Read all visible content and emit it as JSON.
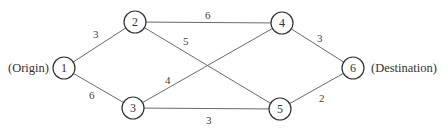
{
  "diagram": {
    "type": "network",
    "labels": {
      "origin": "(Origin)",
      "destination": "(Destination)"
    },
    "nodes": [
      {
        "id": "1",
        "label": "1",
        "x": 64,
        "y": 68
      },
      {
        "id": "2",
        "label": "2",
        "x": 135,
        "y": 22
      },
      {
        "id": "3",
        "label": "3",
        "x": 133,
        "y": 108
      },
      {
        "id": "4",
        "label": "4",
        "x": 282,
        "y": 23
      },
      {
        "id": "5",
        "label": "5",
        "x": 280,
        "y": 109
      },
      {
        "id": "6",
        "label": "6",
        "x": 353,
        "y": 68
      }
    ],
    "edges": [
      {
        "from": "1",
        "to": "2",
        "weight": "3"
      },
      {
        "from": "1",
        "to": "3",
        "weight": "6"
      },
      {
        "from": "2",
        "to": "4",
        "weight": "6"
      },
      {
        "from": "2",
        "to": "5",
        "weight": "5"
      },
      {
        "from": "3",
        "to": "4",
        "weight": "4"
      },
      {
        "from": "3",
        "to": "5",
        "weight": "3"
      },
      {
        "from": "4",
        "to": "6",
        "weight": "3"
      },
      {
        "from": "5",
        "to": "6",
        "weight": "2"
      }
    ]
  }
}
